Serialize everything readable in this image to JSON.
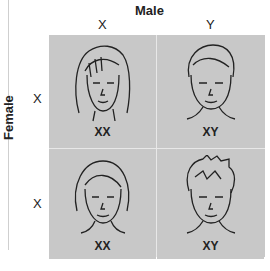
{
  "figure": {
    "male_label": "Male",
    "female_label": "Female",
    "columns": [
      "X",
      "Y"
    ],
    "rows": [
      "X",
      "X"
    ],
    "cells": [
      {
        "genotype": "XX",
        "face": "girl-long-hair"
      },
      {
        "genotype": "XY",
        "face": "boy-short-hair"
      },
      {
        "genotype": "XX",
        "face": "girl-bob-hair"
      },
      {
        "genotype": "XY",
        "face": "boy-spiky-hair"
      }
    ],
    "colors": {
      "cell_bg": "#c8c8c8",
      "divider": "#e8e8e8",
      "text": "#222222"
    }
  }
}
